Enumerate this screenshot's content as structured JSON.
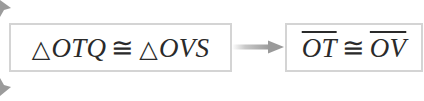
{
  "diagram": {
    "type": "flow-proof-step",
    "left_statement": {
      "triangle_symbol": "△",
      "triangle_1": "OTQ",
      "relation": "≅",
      "triangle_2": "OVS"
    },
    "right_statement": {
      "segment_1": "OT",
      "relation": "≅",
      "segment_2": "OV"
    },
    "connector": "right-arrow",
    "colors": {
      "box_border": "#d4d4d4",
      "text": "#2a2a2a",
      "arrow": "#9a9a9a"
    }
  }
}
